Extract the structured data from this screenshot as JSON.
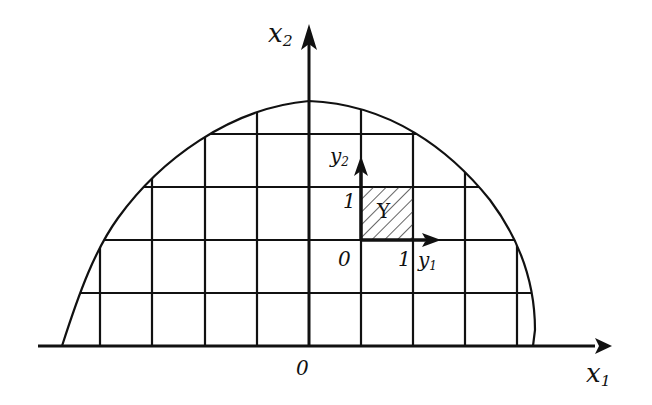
{
  "figure": {
    "axes": {
      "x1": {
        "label": "x",
        "subscript": "1"
      },
      "x2": {
        "label": "x",
        "subscript": "2"
      },
      "origin_label": "0"
    },
    "local_axes": {
      "y1": {
        "label": "y",
        "subscript": "1"
      },
      "y2": {
        "label": "y",
        "subscript": "2"
      },
      "origin_label": "0",
      "tick_y1": "1",
      "tick_y2": "1"
    },
    "cell_label": "Y",
    "colors": {
      "stroke": "#111111",
      "background": "#ffffff"
    }
  }
}
